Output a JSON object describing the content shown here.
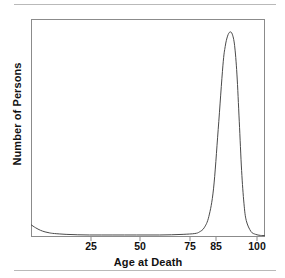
{
  "figure": {
    "background_color": "#ffffff",
    "frame_color": "#8b8b8b",
    "rule_color": "#b9b9b9",
    "curve_color": "#4a4a4a"
  },
  "axis_titles": {
    "x": "Age at Death",
    "y": "Number of Persons"
  },
  "x_ticks": [
    {
      "label": "25",
      "value": 25,
      "px": 91
    },
    {
      "label": "50",
      "value": 50,
      "px": 140
    },
    {
      "label": "75",
      "value": 75,
      "px": 190
    },
    {
      "label": "85",
      "value": 85,
      "px": 216
    },
    {
      "label": "100",
      "value": 100,
      "px": 257
    }
  ],
  "chart_data": {
    "type": "line",
    "title": "",
    "subtitle": "",
    "xlabel": "Age at Death",
    "ylabel": "Number of Persons",
    "xlim": [
      0,
      100
    ],
    "ylim": [
      0,
      1
    ],
    "grid": false,
    "legend": "none",
    "x_tick_labels": [
      "25",
      "50",
      "75",
      "85",
      "100"
    ],
    "x_tick_values": [
      25,
      50,
      75,
      85,
      100
    ],
    "y_tick_labels": [],
    "annotations": [
      "Narrow mortality peak centered at age 85",
      "Small elevated infant-mortality tail near age 0"
    ],
    "series": [
      {
        "name": "Number of Persons",
        "x": [
          0,
          2,
          4,
          6,
          8,
          10,
          15,
          20,
          25,
          30,
          35,
          40,
          45,
          50,
          55,
          60,
          65,
          70,
          72,
          74,
          76,
          78,
          80,
          82,
          83,
          84,
          85,
          86,
          87,
          88,
          89,
          90,
          91,
          92,
          94,
          96,
          98,
          100
        ],
        "y": [
          0.055,
          0.04,
          0.028,
          0.02,
          0.015,
          0.012,
          0.008,
          0.006,
          0.005,
          0.005,
          0.005,
          0.005,
          0.005,
          0.005,
          0.005,
          0.006,
          0.008,
          0.012,
          0.02,
          0.04,
          0.095,
          0.23,
          0.52,
          0.83,
          0.925,
          0.975,
          0.995,
          0.985,
          0.93,
          0.79,
          0.56,
          0.32,
          0.16,
          0.075,
          0.022,
          0.008,
          0.003,
          0.002
        ]
      }
    ]
  }
}
